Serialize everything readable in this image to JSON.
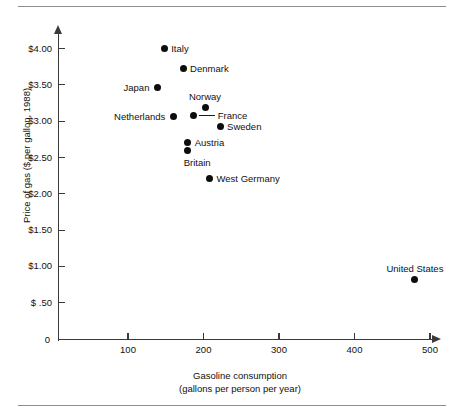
{
  "figure": {
    "kind": "scatter-plot",
    "point_color": "#0d0d0d",
    "axis_color": "#3a3a3a"
  },
  "chart_data": {
    "type": "scatter",
    "title": "",
    "xlabel": "Gasoline consumption",
    "xlabel_sub": "(gallons per person per year)",
    "ylabel": "Price of gas ($ per gallon, 1988)",
    "xlim": [
      0,
      540
    ],
    "ylim": [
      0,
      4.25
    ],
    "grid": false,
    "legend": "none",
    "xticks": [
      {
        "value": 100,
        "label": "100"
      },
      {
        "value": 200,
        "label": "200"
      },
      {
        "value": 300,
        "label": "300"
      },
      {
        "value": 400,
        "label": "400"
      },
      {
        "value": 500,
        "label": "500"
      }
    ],
    "x_origin_label": "0",
    "yticks": [
      {
        "value": 4.0,
        "label": "$4.00"
      },
      {
        "value": 3.5,
        "label": "$3.50"
      },
      {
        "value": 3.0,
        "label": "$3.00"
      },
      {
        "value": 2.5,
        "label": "$2.50"
      },
      {
        "value": 2.0,
        "label": "$2.00"
      },
      {
        "value": 1.5,
        "label": "$1.50"
      },
      {
        "value": 1.0,
        "label": "$1.00"
      },
      {
        "value": 0.5,
        "label": "$ .50"
      }
    ],
    "points": [
      {
        "label": "Italy",
        "x": 148,
        "y": 4.0,
        "label_side": "right"
      },
      {
        "label": "Denmark",
        "x": 173,
        "y": 3.73,
        "label_side": "right"
      },
      {
        "label": "Japan",
        "x": 139,
        "y": 3.47,
        "label_side": "left"
      },
      {
        "label": "Netherlands",
        "x": 160,
        "y": 3.07,
        "label_side": "left"
      },
      {
        "label": "Norway",
        "x": 202,
        "y": 3.19,
        "label_side": "above"
      },
      {
        "label": "France",
        "x": 187,
        "y": 3.08,
        "label_side": "right-leader"
      },
      {
        "label": "Sweden",
        "x": 222,
        "y": 2.93,
        "label_side": "right"
      },
      {
        "label": "Austria",
        "x": 179,
        "y": 2.71,
        "label_side": "right"
      },
      {
        "label": "Britain",
        "x": 179,
        "y": 2.59,
        "label_side": "below"
      },
      {
        "label": "West Germany",
        "x": 208,
        "y": 2.21,
        "label_side": "right"
      },
      {
        "label": "United States",
        "x": 480,
        "y": 0.82,
        "label_side": "above"
      }
    ]
  }
}
